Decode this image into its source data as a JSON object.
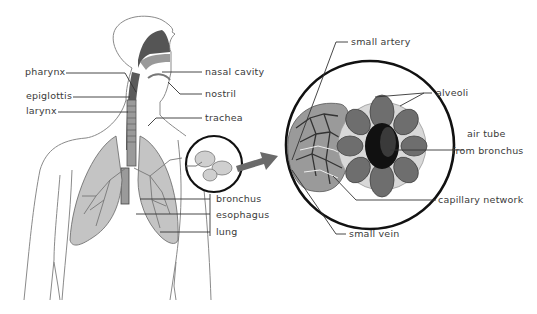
{
  "diagram": {
    "colors": {
      "line": "#333333",
      "outline": "#8a8a8a",
      "lung_fill": "#bdbdbd",
      "alveoli_fill": "#6e6e6e",
      "air_tube": "#111111",
      "arrow": "#666666",
      "circle_stroke": "#111111"
    },
    "labels_body": {
      "pharynx": "pharynx",
      "epiglottis": "epiglottis",
      "larynx": "larynx",
      "nasal_cavity": "nasal cavity",
      "nostril": "nostril",
      "trachea": "trachea",
      "bronchus": "bronchus",
      "esophagus": "esophagus",
      "lung": "lung"
    },
    "labels_detail": {
      "small_artery": "small artery",
      "alveoli": "alveoli",
      "air_tube_line1": "air tube",
      "air_tube_line2": "from bronchus",
      "capillary_network": "capillary network",
      "small_vein": "small vein"
    }
  }
}
